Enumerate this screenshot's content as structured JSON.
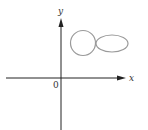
{
  "diagram": {
    "axes": {
      "x_label": "x",
      "y_label": "y",
      "origin_label": "0"
    },
    "shapes": [
      {
        "type": "circle",
        "description": "small closed loop left"
      },
      {
        "type": "ellipse",
        "description": "horizontal elongated loop right"
      }
    ],
    "colors": {
      "axis": "#222222",
      "curve": "#9a9a9a"
    }
  }
}
